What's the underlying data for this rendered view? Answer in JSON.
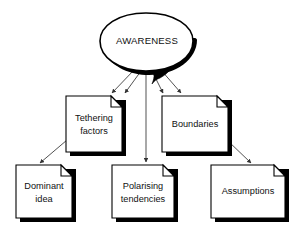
{
  "diagram": {
    "type": "concept-map",
    "title": "AWARENESS",
    "root": {
      "id": "awareness",
      "label": "AWARENESS",
      "shape": "speech-bubble",
      "x": 146,
      "y": 42
    },
    "nodes": [
      {
        "id": "tethering-factors",
        "label_line1": "Tethering",
        "label_line2": "factors",
        "shape": "document",
        "x": 66,
        "y": 96,
        "width": 56,
        "height": 56
      },
      {
        "id": "boundaries",
        "label_line1": "Boundaries",
        "label_line2": "",
        "shape": "document",
        "x": 162,
        "y": 96,
        "width": 66,
        "height": 56
      },
      {
        "id": "dominant-idea",
        "label_line1": "Dominant",
        "label_line2": "idea",
        "shape": "document",
        "x": 16,
        "y": 165,
        "width": 56,
        "height": 53
      },
      {
        "id": "polarising-tendencies",
        "label_line1": "Polarising",
        "label_line2": "tendencies",
        "shape": "document",
        "x": 112,
        "y": 165,
        "width": 62,
        "height": 53
      },
      {
        "id": "assumptions",
        "label_line1": "Assumptions",
        "label_line2": "",
        "shape": "document",
        "x": 211,
        "y": 165,
        "width": 74,
        "height": 53
      }
    ],
    "edges": [
      {
        "from": "awareness",
        "to": "tethering-factors"
      },
      {
        "from": "awareness",
        "to": "boundaries"
      },
      {
        "from": "awareness",
        "to": "polarising-tendencies"
      },
      {
        "from": "tethering-factors",
        "to": "dominant-idea"
      },
      {
        "from": "boundaries",
        "to": "assumptions"
      }
    ],
    "colors": {
      "background": "#ffffff",
      "outline": "#000000",
      "connector": "#333333",
      "text": "#111111",
      "shadow": "#000000"
    }
  }
}
